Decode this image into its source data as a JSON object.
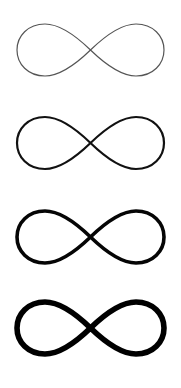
{
  "symbols": [
    {
      "name": "infinity-thin",
      "top": 2,
      "stroke_width": 1.2,
      "color": "#555555"
    },
    {
      "name": "infinity-regular",
      "top": 95,
      "stroke_width": 2.2,
      "color": "#111111"
    },
    {
      "name": "infinity-bold",
      "top": 189,
      "stroke_width": 3.6,
      "color": "#050505"
    },
    {
      "name": "infinity-extra-bold",
      "top": 280,
      "stroke_width": 5.6,
      "color": "#000000"
    }
  ]
}
